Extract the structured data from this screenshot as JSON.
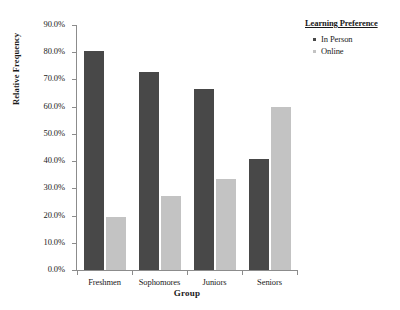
{
  "top_sliver_text": "cut-off header text",
  "chart_data": {
    "type": "bar",
    "title": "",
    "xlabel": "Group",
    "ylabel": "Relative Frequency",
    "categories": [
      "Freshmen",
      "Sophomores",
      "Juniors",
      "Seniors"
    ],
    "series": [
      {
        "name": "In Person",
        "color": "#484848",
        "values": [
          80.5,
          72.8,
          66.6,
          40.8
        ]
      },
      {
        "name": "Online",
        "color": "#c3c3c3",
        "values": [
          19.5,
          27.2,
          33.4,
          59.8
        ]
      }
    ],
    "ylim": [
      0,
      90
    ],
    "ytick_values": [
      0,
      10,
      20,
      30,
      40,
      50,
      60,
      70,
      80,
      90
    ],
    "ytick_labels": [
      "0.0%",
      "10.0%",
      "20.0%",
      "30.0%",
      "40.0%",
      "50.0%",
      "60.0%",
      "70.0%",
      "80.0%",
      "90.0%"
    ],
    "grid": false,
    "legend": {
      "title": "Learning Preference",
      "position": "right-top"
    }
  },
  "legend": {
    "title": "Learning Preference",
    "items": [
      {
        "label": "In Person",
        "color": "#484848"
      },
      {
        "label": "Online",
        "color": "#c3c3c3"
      }
    ]
  },
  "axes": {
    "x_title": "Group",
    "y_title": "Relative Frequency"
  }
}
